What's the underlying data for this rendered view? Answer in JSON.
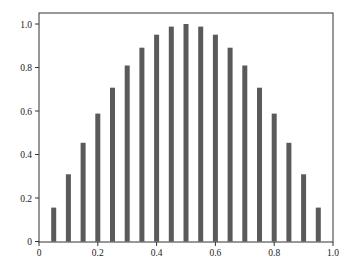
{
  "chart_data": {
    "type": "bar",
    "title": "",
    "xlabel": "",
    "ylabel": "",
    "x": [
      0.05,
      0.1,
      0.15,
      0.2,
      0.25,
      0.3,
      0.35,
      0.4,
      0.45,
      0.5,
      0.55,
      0.6,
      0.65,
      0.7,
      0.75,
      0.8,
      0.85,
      0.9,
      0.95
    ],
    "values": [
      0.156,
      0.309,
      0.454,
      0.588,
      0.707,
      0.809,
      0.891,
      0.951,
      0.988,
      1.0,
      0.988,
      0.951,
      0.891,
      0.809,
      0.707,
      0.588,
      0.454,
      0.309,
      0.156
    ],
    "xlim": [
      0,
      1.0
    ],
    "ylim": [
      0,
      1.05
    ],
    "xticks": [
      0,
      0.2,
      0.4,
      0.6,
      0.8,
      1.0
    ],
    "xtick_labels": [
      "0",
      "0.2",
      "0.4",
      "0.6",
      "0.8",
      "1.0"
    ],
    "yticks": [
      0,
      0.2,
      0.4,
      0.6,
      0.8,
      1.0
    ],
    "ytick_labels": [
      "0",
      "0.2",
      "0.4",
      "0.6",
      "0.8",
      "1.0"
    ],
    "grid": false,
    "legend": null,
    "bar_color": "#5a5a5a"
  }
}
